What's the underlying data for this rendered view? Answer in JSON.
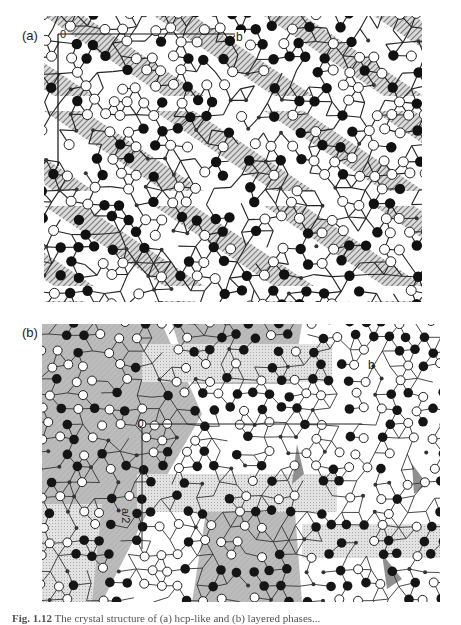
{
  "figure": {
    "panels": [
      {
        "id": "a",
        "label": "(a)",
        "axis_labels": {
          "origin": "0",
          "b": "b"
        },
        "style": "hatched",
        "colors": {
          "filled_atom": "#111111",
          "open_atom": "#ffffff",
          "bond": "#222222",
          "hatch": "#333333",
          "shade": "#bdbdbd"
        }
      },
      {
        "id": "b",
        "label": "(b)",
        "axis_labels": {
          "origin": "0",
          "b": "b",
          "a_half": "a/2"
        },
        "style": "shaded",
        "colors": {
          "filled_atom": "#151515",
          "open_atom": "#ffffff",
          "bond": "#333333",
          "shade": "#bcbcbc",
          "light_shade": "#e2e2e2",
          "wedge": "#8f8f8f"
        }
      }
    ],
    "caption": {
      "number": "Fig. 1.12",
      "text": "The crystal structure of (a) hcp-like and (b) layered phases..."
    }
  }
}
